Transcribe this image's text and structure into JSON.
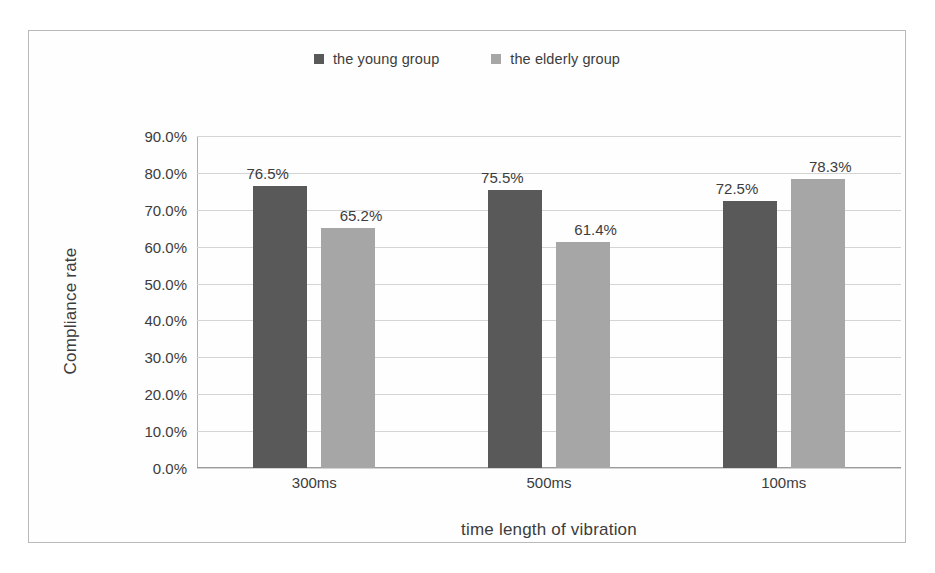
{
  "chart_data": {
    "type": "bar",
    "title": "",
    "xlabel": "time length of vibration",
    "ylabel": "Compliance rate",
    "categories": [
      "300ms",
      "500ms",
      "100ms"
    ],
    "series": [
      {
        "name": "the young group",
        "color": "#595959",
        "values": [
          76.5,
          75.5,
          72.5
        ],
        "labels": [
          "76.5%",
          "75.5%",
          "72.5%"
        ]
      },
      {
        "name": "the elderly group",
        "color": "#a6a6a6",
        "values": [
          65.2,
          61.4,
          78.3
        ],
        "labels": [
          "65.2%",
          "61.4%",
          "78.3%"
        ]
      }
    ],
    "ylim": [
      0,
      90
    ],
    "ytick_values": [
      90,
      80,
      70,
      60,
      50,
      40,
      30,
      20,
      10,
      0
    ],
    "ytick_labels": [
      "90.0%",
      "80.0%",
      "70.0%",
      "60.0%",
      "50.0%",
      "40.0%",
      "30.0%",
      "20.0%",
      "10.0%",
      "0.0%"
    ],
    "grid": true,
    "legend_position": "top-center",
    "value_labels_shown": true,
    "units": "percent"
  }
}
